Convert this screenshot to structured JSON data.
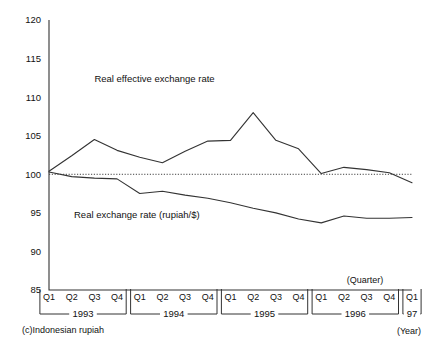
{
  "chart_data": {
    "type": "line",
    "title": "",
    "caption": "(c)Indonesian rupiah",
    "xlabel": "",
    "ylabel": "",
    "ylim": [
      85,
      120
    ],
    "yticks": [
      85,
      90,
      95,
      100,
      105,
      110,
      115,
      120
    ],
    "grid": false,
    "legend_position": "inline-annotation",
    "quarter_axis_note": "(Quarter)",
    "year_axis_note": "(Year)",
    "reference_line": {
      "value": 100,
      "style": "dotted"
    },
    "x": [
      "1993 Q1",
      "1993 Q2",
      "1993 Q3",
      "1993 Q4",
      "1994 Q1",
      "1994 Q2",
      "1994 Q3",
      "1994 Q4",
      "1995 Q1",
      "1995 Q2",
      "1995 Q3",
      "1995 Q4",
      "1996 Q1",
      "1996 Q2",
      "1996 Q3",
      "1996 Q4",
      "1997 Q1"
    ],
    "quarter_labels": [
      "Q1",
      "Q2",
      "Q3",
      "Q4",
      "Q1",
      "Q2",
      "Q3",
      "Q4",
      "Q1",
      "Q2",
      "Q3",
      "Q4",
      "Q1",
      "Q2",
      "Q3",
      "Q4",
      "Q1"
    ],
    "year_groups": [
      {
        "label": "1993",
        "start": 0,
        "end": 3
      },
      {
        "label": "1994",
        "start": 4,
        "end": 7
      },
      {
        "label": "1995",
        "start": 8,
        "end": 11
      },
      {
        "label": "1996",
        "start": 12,
        "end": 15
      },
      {
        "label": "97",
        "start": 16,
        "end": 16
      }
    ],
    "series": [
      {
        "name": "Real effective exchange rate",
        "label_x_index": 2.0,
        "label_y": 112.0,
        "values": [
          100.4,
          102.4,
          104.5,
          103.1,
          102.2,
          101.5,
          103.0,
          104.3,
          104.4,
          108.0,
          104.4,
          103.3,
          100.1,
          100.9,
          100.6,
          100.2,
          98.9
        ]
      },
      {
        "name": "Real exchange rate (rupiah/$)",
        "label_x_index": 1.1,
        "label_y": 94.4,
        "values": [
          100.3,
          99.7,
          99.5,
          99.4,
          97.5,
          97.8,
          97.3,
          96.9,
          96.3,
          95.6,
          95.0,
          94.2,
          93.7,
          94.6,
          94.3,
          94.3,
          94.4
        ]
      }
    ]
  }
}
